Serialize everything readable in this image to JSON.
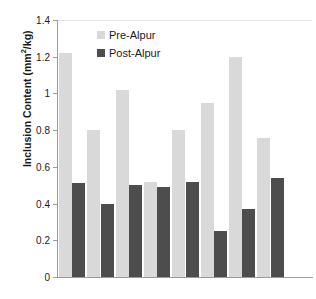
{
  "chart_data": {
    "type": "bar",
    "title": "",
    "xlabel": "",
    "ylabel": "Inclusion Content (mm²/kg)",
    "ylabel_prefix": "Inclusion Content (mm",
    "ylabel_sup": "2",
    "ylabel_suffix": "/kg)",
    "ylim": [
      0,
      1.4
    ],
    "yticks": [
      0,
      0.2,
      0.4,
      0.6,
      0.8,
      1,
      1.2,
      1.4
    ],
    "ytick_labels": [
      "0",
      "0.2",
      "0.4",
      "0.6",
      "0.8",
      "1",
      "1.2",
      "1.4"
    ],
    "grid": false,
    "legend_position": "top-center",
    "categories": [
      "1",
      "2",
      "3",
      "4",
      "5",
      "6",
      "7",
      "8",
      "9"
    ],
    "xtick_labels": [
      "",
      "",
      "",
      "",
      "",
      "",
      "",
      "",
      ""
    ],
    "series": [
      {
        "name": "Pre-Alpur",
        "color": "#d9d9d9",
        "values": [
          1.22,
          0.8,
          1.02,
          0.52,
          0.8,
          0.95,
          1.2,
          0.76,
          0.0
        ]
      },
      {
        "name": "Post-Alpur",
        "color": "#4d4d4d",
        "values": [
          0.51,
          0.4,
          0.5,
          0.49,
          0.52,
          0.25,
          0.37,
          0.54,
          0.0
        ]
      }
    ],
    "bars": [
      {
        "group": 1,
        "series": "Pre-Alpur",
        "value": 1.22
      },
      {
        "group": 1,
        "series": "Post-Alpur",
        "value": 0.51
      },
      {
        "group": 2,
        "series": "Pre-Alpur",
        "value": 0.8
      },
      {
        "group": 2,
        "series": "Post-Alpur",
        "value": 0.4
      },
      {
        "group": 3,
        "series": "Pre-Alpur",
        "value": 1.02
      },
      {
        "group": 3,
        "series": "Post-Alpur",
        "value": 0.5
      },
      {
        "group": 4,
        "series": "Pre-Alpur",
        "value": 0.52
      },
      {
        "group": 4,
        "series": "Post-Alpur",
        "value": 0.49
      },
      {
        "group": 5,
        "series": "Pre-Alpur",
        "value": 0.8
      },
      {
        "group": 5,
        "series": "Post-Alpur",
        "value": 0.52
      },
      {
        "group": 6,
        "series": "Pre-Alpur",
        "value": 0.95
      },
      {
        "group": 6,
        "series": "Post-Alpur",
        "value": 0.25
      },
      {
        "group": 7,
        "series": "Pre-Alpur",
        "value": 1.2
      },
      {
        "group": 7,
        "series": "Post-Alpur",
        "value": 0.37
      },
      {
        "group": 8,
        "series": "Pre-Alpur",
        "value": 0.76
      },
      {
        "group": 8,
        "series": "Post-Alpur",
        "value": 0.54
      }
    ]
  },
  "legend": {
    "entries": [
      {
        "label": "Pre-Alpur",
        "color": "#d9d9d9"
      },
      {
        "label": "Post-Alpur",
        "color": "#4d4d4d"
      }
    ]
  },
  "caption": {
    "text": ""
  }
}
